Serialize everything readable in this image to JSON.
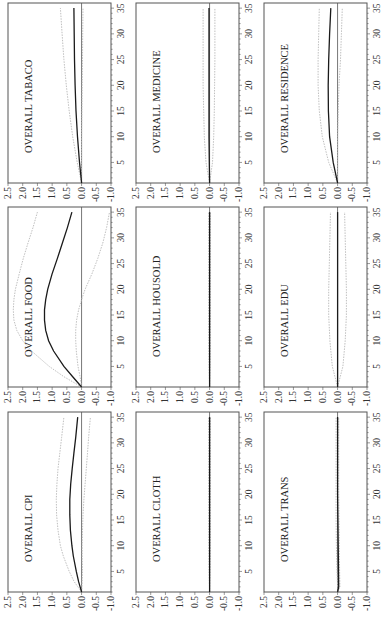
{
  "figure": {
    "rotation_deg": -90,
    "layout": {
      "rows": 3,
      "cols": 3
    },
    "colors": {
      "mean_line": "#1a1a1a",
      "band_line": "#b8b8b8",
      "zero_line": "#555555",
      "frame": "#555555",
      "text": "#333333"
    }
  },
  "chart_data": [
    {
      "type": "line",
      "title": "OVERALL TABACO",
      "grid_pos": [
        0,
        0
      ],
      "xlabel": "",
      "ylabel": "",
      "xlim": [
        1,
        36
      ],
      "ylim": [
        -1.0,
        2.5
      ],
      "xticks": [
        5,
        10,
        15,
        20,
        25,
        30,
        35
      ],
      "yticks": [
        "2.5",
        "2.0",
        "1.5",
        "1.0",
        "0.5",
        "0.0",
        "-0.5",
        "-1.0"
      ],
      "x": [
        1,
        5,
        10,
        15,
        20,
        25,
        30,
        35
      ],
      "series": [
        {
          "name": "response",
          "values": [
            0.0,
            0.07,
            0.14,
            0.19,
            0.22,
            0.24,
            0.25,
            0.26
          ]
        },
        {
          "name": "upper",
          "values": [
            0.0,
            0.15,
            0.3,
            0.42,
            0.52,
            0.6,
            0.66,
            0.72
          ]
        },
        {
          "name": "lower",
          "values": [
            0.0,
            0.0,
            0.0,
            -0.01,
            -0.02,
            -0.03,
            -0.04,
            -0.05
          ]
        }
      ]
    },
    {
      "type": "line",
      "title": "OVERALL MEDICINE",
      "grid_pos": [
        0,
        1
      ],
      "xlabel": "",
      "ylabel": "",
      "xlim": [
        1,
        36
      ],
      "ylim": [
        -1.0,
        2.5
      ],
      "xticks": [
        5,
        10,
        15,
        20,
        25,
        30,
        35
      ],
      "yticks": [
        "2.5",
        "2.0",
        "1.5",
        "1.0",
        "0.5",
        "0.0",
        "-0.5",
        "-1.0"
      ],
      "x": [
        1,
        5,
        10,
        15,
        20,
        25,
        30,
        35
      ],
      "series": [
        {
          "name": "response",
          "values": [
            0.0,
            0.01,
            0.02,
            0.02,
            0.02,
            0.02,
            0.02,
            0.02
          ]
        },
        {
          "name": "upper",
          "values": [
            0.0,
            0.12,
            0.18,
            0.2,
            0.22,
            0.22,
            0.22,
            0.22
          ]
        },
        {
          "name": "lower",
          "values": [
            0.0,
            -0.1,
            -0.14,
            -0.16,
            -0.17,
            -0.18,
            -0.18,
            -0.18
          ]
        }
      ]
    },
    {
      "type": "line",
      "title": "OVERALL RESIDENCE",
      "grid_pos": [
        0,
        2
      ],
      "xlabel": "",
      "ylabel": "",
      "xlim": [
        1,
        36
      ],
      "ylim": [
        -1.0,
        2.5
      ],
      "xticks": [
        5,
        10,
        15,
        20,
        25,
        30,
        35
      ],
      "yticks": [
        "2.5",
        "2.0",
        "1.5",
        "1.0",
        "0.5",
        "0.0",
        "-0.5",
        "-1.0"
      ],
      "x": [
        1,
        5,
        10,
        15,
        20,
        25,
        30,
        35
      ],
      "series": [
        {
          "name": "response",
          "values": [
            0.0,
            0.15,
            0.27,
            0.31,
            0.32,
            0.3,
            0.27,
            0.23
          ]
        },
        {
          "name": "upper",
          "values": [
            0.0,
            0.3,
            0.52,
            0.62,
            0.66,
            0.66,
            0.64,
            0.62
          ]
        },
        {
          "name": "lower",
          "values": [
            0.0,
            0.0,
            0.0,
            -0.02,
            -0.05,
            -0.1,
            -0.13,
            -0.16
          ]
        }
      ]
    },
    {
      "type": "line",
      "title": "OVERALL FOOD",
      "grid_pos": [
        1,
        0
      ],
      "xlabel": "",
      "ylabel": "",
      "xlim": [
        1,
        36
      ],
      "ylim": [
        -1.0,
        2.5
      ],
      "xticks": [
        5,
        10,
        15,
        20,
        25,
        30,
        35
      ],
      "yticks": [
        "2.5",
        "2.0",
        "1.5",
        "1.0",
        "0.5",
        "0.0",
        "-0.5",
        "-1.0"
      ],
      "x": [
        1,
        3,
        5,
        8,
        10,
        12,
        14,
        16,
        18,
        20,
        23,
        26,
        29,
        32,
        35
      ],
      "series": [
        {
          "name": "response",
          "values": [
            0.0,
            0.3,
            0.6,
            0.95,
            1.12,
            1.22,
            1.26,
            1.26,
            1.22,
            1.15,
            1.0,
            0.82,
            0.65,
            0.48,
            0.33
          ]
        },
        {
          "name": "upper",
          "values": [
            0.0,
            0.6,
            1.1,
            1.7,
            2.0,
            2.2,
            2.3,
            2.32,
            2.3,
            2.25,
            2.12,
            1.98,
            1.82,
            1.65,
            1.5
          ]
        },
        {
          "name": "lower",
          "values": [
            0.0,
            0.05,
            0.12,
            0.18,
            0.2,
            0.2,
            0.17,
            0.1,
            0.0,
            -0.12,
            -0.35,
            -0.55,
            -0.72,
            -0.85,
            -0.95
          ]
        }
      ]
    },
    {
      "type": "line",
      "title": "OVERALL HOUSOLD",
      "grid_pos": [
        1,
        1
      ],
      "xlabel": "",
      "ylabel": "",
      "xlim": [
        1,
        36
      ],
      "ylim": [
        -1.0,
        2.5
      ],
      "xticks": [
        5,
        10,
        15,
        20,
        25,
        30,
        35
      ],
      "yticks": [
        "2.5",
        "2.0",
        "1.5",
        "1.0",
        "0.5",
        "0.0",
        "-0.5",
        "-1.0"
      ],
      "x": [
        1,
        5,
        10,
        15,
        20,
        25,
        30,
        35
      ],
      "series": [
        {
          "name": "response",
          "values": [
            0.0,
            0.0,
            0.0,
            0.0,
            0.0,
            0.0,
            0.0,
            0.0
          ]
        },
        {
          "name": "upper",
          "values": [
            0.0,
            0.02,
            0.03,
            0.03,
            0.03,
            0.03,
            0.03,
            0.03
          ]
        },
        {
          "name": "lower",
          "values": [
            0.0,
            -0.02,
            -0.03,
            -0.03,
            -0.03,
            -0.03,
            -0.03,
            -0.03
          ]
        }
      ]
    },
    {
      "type": "line",
      "title": "OVERALL EDU",
      "grid_pos": [
        1,
        2
      ],
      "xlabel": "",
      "ylabel": "",
      "xlim": [
        1,
        36
      ],
      "ylim": [
        -1.0,
        2.5
      ],
      "xticks": [
        5,
        10,
        15,
        20,
        25,
        30,
        35
      ],
      "yticks": [
        "2.5",
        "2.0",
        "1.5",
        "1.0",
        "0.5",
        "0.0",
        "-0.5",
        "-1.0"
      ],
      "x": [
        1,
        5,
        10,
        15,
        20,
        25,
        30,
        35
      ],
      "series": [
        {
          "name": "response",
          "values": [
            0.0,
            0.0,
            0.0,
            0.0,
            0.0,
            0.0,
            0.0,
            0.0
          ]
        },
        {
          "name": "upper",
          "values": [
            0.0,
            0.18,
            0.26,
            0.3,
            0.3,
            0.28,
            0.26,
            0.24
          ]
        },
        {
          "name": "lower",
          "values": [
            0.0,
            -0.18,
            -0.26,
            -0.3,
            -0.3,
            -0.28,
            -0.26,
            -0.24
          ]
        }
      ]
    },
    {
      "type": "line",
      "title": "OVERALL CPI",
      "grid_pos": [
        2,
        0
      ],
      "xlabel": "",
      "ylabel": "",
      "xlim": [
        1,
        36
      ],
      "ylim": [
        -1.0,
        2.5
      ],
      "xticks": [
        5,
        10,
        15,
        20,
        25,
        30,
        35
      ],
      "yticks": [
        "2.5",
        "2.0",
        "1.5",
        "1.0",
        "0.5",
        "0.0",
        "-0.5",
        "-1.0"
      ],
      "x": [
        1,
        3,
        5,
        8,
        10,
        13,
        16,
        19,
        22,
        25,
        28,
        31,
        35
      ],
      "series": [
        {
          "name": "response",
          "values": [
            0.0,
            0.1,
            0.18,
            0.28,
            0.33,
            0.38,
            0.4,
            0.4,
            0.37,
            0.32,
            0.26,
            0.2,
            0.13
          ]
        },
        {
          "name": "upper",
          "values": [
            0.0,
            0.25,
            0.42,
            0.62,
            0.72,
            0.8,
            0.85,
            0.86,
            0.84,
            0.8,
            0.74,
            0.68,
            0.6
          ]
        },
        {
          "name": "lower",
          "values": [
            0.0,
            -0.02,
            -0.03,
            -0.02,
            -0.02,
            -0.03,
            -0.05,
            -0.08,
            -0.12,
            -0.16,
            -0.2,
            -0.24,
            -0.3
          ]
        }
      ]
    },
    {
      "type": "line",
      "title": "OVERALL CLOTH",
      "grid_pos": [
        2,
        1
      ],
      "xlabel": "",
      "ylabel": "",
      "xlim": [
        1,
        36
      ],
      "ylim": [
        -1.0,
        2.5
      ],
      "xticks": [
        5,
        10,
        15,
        20,
        25,
        30,
        35
      ],
      "yticks": [
        "2.5",
        "2.0",
        "1.5",
        "1.0",
        "0.5",
        "0.0",
        "-0.5",
        "-1.0"
      ],
      "x": [
        1,
        5,
        10,
        15,
        20,
        25,
        30,
        35
      ],
      "series": [
        {
          "name": "response",
          "values": [
            0.0,
            0.0,
            0.0,
            0.0,
            0.0,
            0.0,
            0.0,
            0.0
          ]
        },
        {
          "name": "upper",
          "values": [
            0.0,
            0.02,
            0.03,
            0.03,
            0.03,
            0.03,
            0.03,
            0.03
          ]
        },
        {
          "name": "lower",
          "values": [
            0.0,
            -0.02,
            -0.03,
            -0.03,
            -0.03,
            -0.03,
            -0.03,
            -0.03
          ]
        }
      ]
    },
    {
      "type": "line",
      "title": "OVERALL TRANS",
      "grid_pos": [
        2,
        2
      ],
      "xlabel": "",
      "ylabel": "",
      "xlim": [
        1,
        36
      ],
      "ylim": [
        -1.0,
        2.5
      ],
      "xticks": [
        5,
        10,
        15,
        20,
        25,
        30,
        35
      ],
      "yticks": [
        "2.5",
        "2.0",
        "1.5",
        "1.0",
        "0.5",
        "0.0",
        "-0.5",
        "-1.0"
      ],
      "x": [
        1,
        2,
        5,
        10,
        15,
        20,
        25,
        30,
        35
      ],
      "series": [
        {
          "name": "response",
          "values": [
            0.0,
            -0.04,
            -0.03,
            -0.02,
            -0.01,
            0.0,
            0.0,
            0.0,
            0.0
          ]
        },
        {
          "name": "upper",
          "values": [
            0.0,
            0.0,
            0.02,
            0.04,
            0.05,
            0.05,
            0.05,
            0.05,
            0.05
          ]
        },
        {
          "name": "lower",
          "values": [
            0.0,
            -0.08,
            -0.07,
            -0.06,
            -0.05,
            -0.04,
            -0.04,
            -0.04,
            -0.04
          ]
        }
      ]
    }
  ]
}
